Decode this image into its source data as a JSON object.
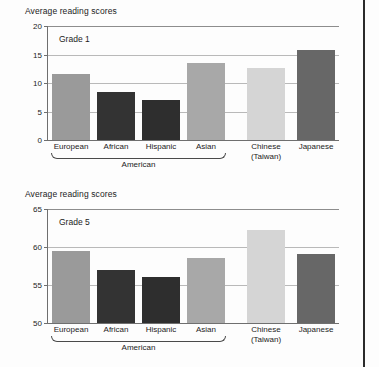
{
  "figure": {
    "right_border_color": "#2b2b2b"
  },
  "palette": {
    "european": "#9a9a9a",
    "african": "#333333",
    "hispanic": "#2e2e2e",
    "asian": "#a8a8a8",
    "chinese": "#d5d5d5",
    "japanese": "#676767",
    "gridline": "#b9b9b9",
    "axis": "#6f6f6f",
    "text": "#1c1c1c"
  },
  "chart_data": [
    {
      "type": "bar",
      "title": "Average reading scores",
      "annotation": "Grade 1",
      "xlabel": "",
      "ylabel": "",
      "ylim": [
        0,
        20
      ],
      "yticks": [
        "0",
        "5",
        "10",
        "15",
        "20"
      ],
      "grid": true,
      "legend": "none",
      "group_bracket_label": "American",
      "group_bracket_categories": [
        "European",
        "African",
        "Hispanic",
        "Asian"
      ],
      "categories": [
        "European",
        "African",
        "Hispanic",
        "Asian",
        "Chinese\n(Taiwan)",
        "Japanese"
      ],
      "category_lines": [
        [
          "European",
          ""
        ],
        [
          "African",
          ""
        ],
        [
          "Hispanic",
          ""
        ],
        [
          "Asian",
          ""
        ],
        [
          "Chinese",
          "(Taiwan)"
        ],
        [
          "Japanese",
          ""
        ]
      ],
      "values": [
        11.6,
        8.4,
        7.0,
        13.5,
        12.6,
        15.8
      ],
      "colors": [
        "#9a9a9a",
        "#333333",
        "#2e2e2e",
        "#a8a8a8",
        "#d5d5d5",
        "#676767"
      ]
    },
    {
      "type": "bar",
      "title": "Average reading scores",
      "annotation": "Grade 5",
      "xlabel": "",
      "ylabel": "",
      "ylim": [
        50,
        65
      ],
      "yticks": [
        "50",
        "55",
        "60",
        "65"
      ],
      "grid": true,
      "legend": "none",
      "group_bracket_label": "American",
      "group_bracket_categories": [
        "European",
        "African",
        "Hispanic",
        "Asian"
      ],
      "categories": [
        "European",
        "African",
        "Hispanic",
        "Asian",
        "Chinese\n(Taiwan)",
        "Japanese"
      ],
      "category_lines": [
        [
          "European",
          ""
        ],
        [
          "African",
          ""
        ],
        [
          "Hispanic",
          ""
        ],
        [
          "Asian",
          ""
        ],
        [
          "Chinese",
          "(Taiwan)"
        ],
        [
          "Japanese",
          ""
        ]
      ],
      "values": [
        59.5,
        57.0,
        56.0,
        58.5,
        62.2,
        59.1
      ],
      "colors": [
        "#9a9a9a",
        "#333333",
        "#2e2e2e",
        "#a8a8a8",
        "#d5d5d5",
        "#676767"
      ]
    }
  ]
}
